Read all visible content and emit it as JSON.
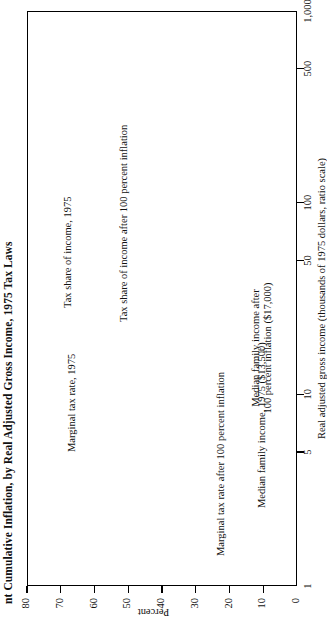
{
  "figure": {
    "title": "nt Cumulative Inflation, by Real Adjusted Gross Income, 1975 Tax Laws",
    "title_truncated": true
  },
  "chart_data": {
    "type": "line",
    "title": "nt Cumulative Inflation, by Real Adjusted Gross Income, 1975 Tax Laws",
    "xlabel": "Real adjusted gross income (thousands of 1975 dollars, ratio scale)",
    "ylabel": "Percent",
    "xscale": "log",
    "xlim": [
      1,
      1000
    ],
    "ylim": [
      0,
      80
    ],
    "xticks": [
      1,
      5,
      10,
      50,
      100,
      500,
      1000
    ],
    "xticklabels": [
      "1",
      "5",
      "10",
      "50",
      "100",
      "500",
      "1,000"
    ],
    "yticks": [
      0,
      10,
      20,
      30,
      40,
      50,
      60,
      70,
      80
    ],
    "yticklabels": [
      "0",
      "10",
      "20",
      "30",
      "40",
      "50",
      "60",
      "70",
      "80"
    ],
    "grid": false,
    "legend": "none (curves labelled in-place)",
    "series": [
      {
        "name": "Marginal tax rate after 100 percent inflation",
        "style": "step",
        "points": [
          [
            1,
            0
          ],
          [
            3.3,
            0
          ],
          [
            3.3,
            14
          ],
          [
            4.0,
            14
          ],
          [
            4.0,
            15
          ],
          [
            4.6,
            15
          ],
          [
            4.6,
            16
          ],
          [
            5.2,
            16
          ],
          [
            5.2,
            17
          ],
          [
            5.9,
            17
          ],
          [
            5.9,
            19
          ],
          [
            6.8,
            19
          ],
          [
            6.8,
            21
          ],
          [
            8.0,
            21
          ],
          [
            8.0,
            24
          ],
          [
            9.6,
            24
          ],
          [
            9.6,
            25
          ],
          [
            11.5,
            25
          ],
          [
            11.5,
            28
          ],
          [
            14,
            28
          ],
          [
            14,
            32
          ],
          [
            17,
            32
          ],
          [
            17,
            36
          ],
          [
            21,
            36
          ],
          [
            21,
            39
          ],
          [
            26,
            39
          ],
          [
            26,
            42
          ],
          [
            32,
            42
          ],
          [
            32,
            45
          ],
          [
            40,
            45
          ],
          [
            40,
            48
          ],
          [
            50,
            48
          ],
          [
            50,
            53
          ],
          [
            64,
            53
          ],
          [
            64,
            55
          ],
          [
            82,
            55
          ],
          [
            82,
            58
          ],
          [
            105,
            58
          ],
          [
            105,
            60
          ],
          [
            140,
            60
          ],
          [
            140,
            62
          ],
          [
            190,
            62
          ],
          [
            190,
            64
          ],
          [
            260,
            64
          ],
          [
            260,
            66
          ],
          [
            360,
            66
          ],
          [
            360,
            68
          ],
          [
            520,
            68
          ],
          [
            520,
            70
          ],
          [
            1000,
            70
          ]
        ]
      },
      {
        "name": "Marginal tax rate, 1975",
        "style": "step",
        "points": [
          [
            1,
            0
          ],
          [
            4.4,
            0
          ],
          [
            4.4,
            14
          ],
          [
            5.4,
            14
          ],
          [
            5.4,
            15
          ],
          [
            6.2,
            15
          ],
          [
            6.2,
            16
          ],
          [
            7.1,
            16
          ],
          [
            7.1,
            17
          ],
          [
            8.1,
            17
          ],
          [
            8.1,
            19
          ],
          [
            9.4,
            19
          ],
          [
            9.4,
            21
          ],
          [
            11,
            21
          ],
          [
            11,
            24
          ],
          [
            13.3,
            24
          ],
          [
            13.3,
            25
          ],
          [
            16,
            25
          ],
          [
            16,
            28
          ],
          [
            19.5,
            28
          ],
          [
            19.5,
            32
          ],
          [
            24,
            32
          ],
          [
            24,
            36
          ],
          [
            30,
            36
          ],
          [
            30,
            39
          ],
          [
            37,
            39
          ],
          [
            37,
            42
          ],
          [
            46,
            42
          ],
          [
            46,
            45
          ],
          [
            58,
            45
          ],
          [
            58,
            48
          ],
          [
            73,
            48
          ],
          [
            73,
            53
          ],
          [
            93,
            53
          ],
          [
            93,
            55
          ],
          [
            120,
            55
          ],
          [
            120,
            58
          ],
          [
            155,
            58
          ],
          [
            155,
            60
          ],
          [
            205,
            60
          ],
          [
            205,
            62
          ],
          [
            275,
            62
          ],
          [
            275,
            64
          ],
          [
            380,
            64
          ],
          [
            380,
            66
          ],
          [
            540,
            66
          ],
          [
            540,
            68
          ],
          [
            780,
            68
          ],
          [
            780,
            70
          ],
          [
            1000,
            70
          ]
        ]
      },
      {
        "name": "Tax share of income, 1975",
        "style": "smooth",
        "points": [
          [
            3.6,
            0
          ],
          [
            4.5,
            1.5
          ],
          [
            6,
            4
          ],
          [
            8,
            6.5
          ],
          [
            11,
            9.5
          ],
          [
            15,
            12
          ],
          [
            21,
            15
          ],
          [
            30,
            18.5
          ],
          [
            45,
            23
          ],
          [
            70,
            28
          ],
          [
            110,
            34
          ],
          [
            170,
            40
          ],
          [
            270,
            47
          ],
          [
            430,
            55
          ],
          [
            700,
            63
          ],
          [
            1000,
            70
          ]
        ]
      },
      {
        "name": "Tax share of income after 100 percent inflation",
        "style": "smooth",
        "points": [
          [
            2.6,
            0
          ],
          [
            3.2,
            2
          ],
          [
            4.2,
            5
          ],
          [
            5.6,
            8
          ],
          [
            7.5,
            11
          ],
          [
            10,
            14
          ],
          [
            14,
            17.5
          ],
          [
            20,
            21.5
          ],
          [
            29,
            26
          ],
          [
            44,
            31
          ],
          [
            68,
            37
          ],
          [
            105,
            43
          ],
          [
            165,
            49.5
          ],
          [
            260,
            56.5
          ],
          [
            420,
            63.5
          ],
          [
            680,
            70
          ],
          [
            1000,
            75.5
          ]
        ]
      }
    ],
    "reference_lines": [
      {
        "name": "Median family income, 1975",
        "orientation": "vertical-in-data",
        "value": 13.5,
        "value_label": "$13,500",
        "style": "dashed"
      },
      {
        "name": "Median family income after 100 percent inflation",
        "orientation": "vertical-in-data",
        "value": 17.0,
        "value_label": "$17,000",
        "style": "dashed"
      }
    ],
    "annotations": [
      {
        "id": "ann-marginal-after",
        "text": "Marginal tax rate after 100 percent inflation"
      },
      {
        "id": "ann-marginal-1975",
        "text": "Marginal tax rate, 1975"
      },
      {
        "id": "ann-taxshare-1975",
        "text": "Tax share of income, 1975"
      },
      {
        "id": "ann-taxshare-after",
        "text": "Tax share of income after 100 percent inflation",
        "has_arrow": true
      },
      {
        "id": "ann-median-1975",
        "text": "Median family income, 1975 ($13,500)",
        "has_arrow": true
      },
      {
        "id": "ann-median-after-l1",
        "text": "Median family income after"
      },
      {
        "id": "ann-median-after-l2",
        "text": "100 percent inflation ($17,000)",
        "has_arrow": true
      }
    ]
  },
  "colors": {
    "ink": "#000000",
    "paper": "#ffffff",
    "dashed": "#555555"
  }
}
